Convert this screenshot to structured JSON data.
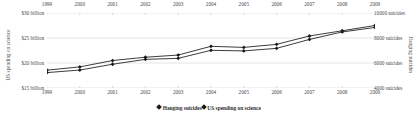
{
  "chart_data": {
    "type": "line",
    "title": "",
    "x": [
      1999,
      2000,
      2001,
      2002,
      2003,
      2004,
      2005,
      2006,
      2007,
      2008,
      2009
    ],
    "xlabel": "",
    "grid": true,
    "legend_position": "bottom",
    "axes": {
      "left": {
        "label": "US spending on science",
        "ticks": [
          "$15 billion",
          "$20 billion",
          "$25 billion",
          "$30 billion"
        ],
        "tick_values": [
          15,
          20,
          25,
          30
        ],
        "ylim": [
          15,
          30
        ],
        "unit": "billion USD"
      },
      "right": {
        "label": "Hanging suicides",
        "ticks": [
          "4000 suicides",
          "6000 suicides",
          "8000 suicides",
          "10000 suicides"
        ],
        "tick_values": [
          4000,
          6000,
          8000,
          10000
        ],
        "ylim": [
          4000,
          10000
        ],
        "unit": "suicides"
      }
    },
    "x_tick_labels_top": [
      "1999",
      "2000",
      "2001",
      "2002",
      "2003",
      "2004",
      "2005",
      "2006",
      "2007",
      "2008",
      "2009"
    ],
    "x_tick_labels_bottom": [
      "1999",
      "2000",
      "2001",
      "2002",
      "2003",
      "2004",
      "2005",
      "2006",
      "2007",
      "2008",
      "2009"
    ],
    "series": [
      {
        "name": "US spending on science",
        "axis": "left",
        "marker": "diamond",
        "color": "#1a1a1a",
        "values": [
          18.08,
          18.59,
          19.75,
          20.73,
          20.93,
          22.54,
          22.42,
          22.93,
          24.71,
          26.21,
          27.11
        ],
        "unit": "billion USD"
      },
      {
        "name": "Hanging suicides",
        "axis": "right",
        "marker": "diamond",
        "color": "#1a1a1a",
        "values": [
          5427,
          5688,
          6198,
          6462,
          6635,
          7336,
          7248,
          7491,
          8161,
          8578,
          9000
        ],
        "unit": "suicides"
      }
    ]
  },
  "legend": {
    "items": [
      {
        "label": "Hanging suicides"
      },
      {
        "label": "US spending on science"
      }
    ]
  }
}
